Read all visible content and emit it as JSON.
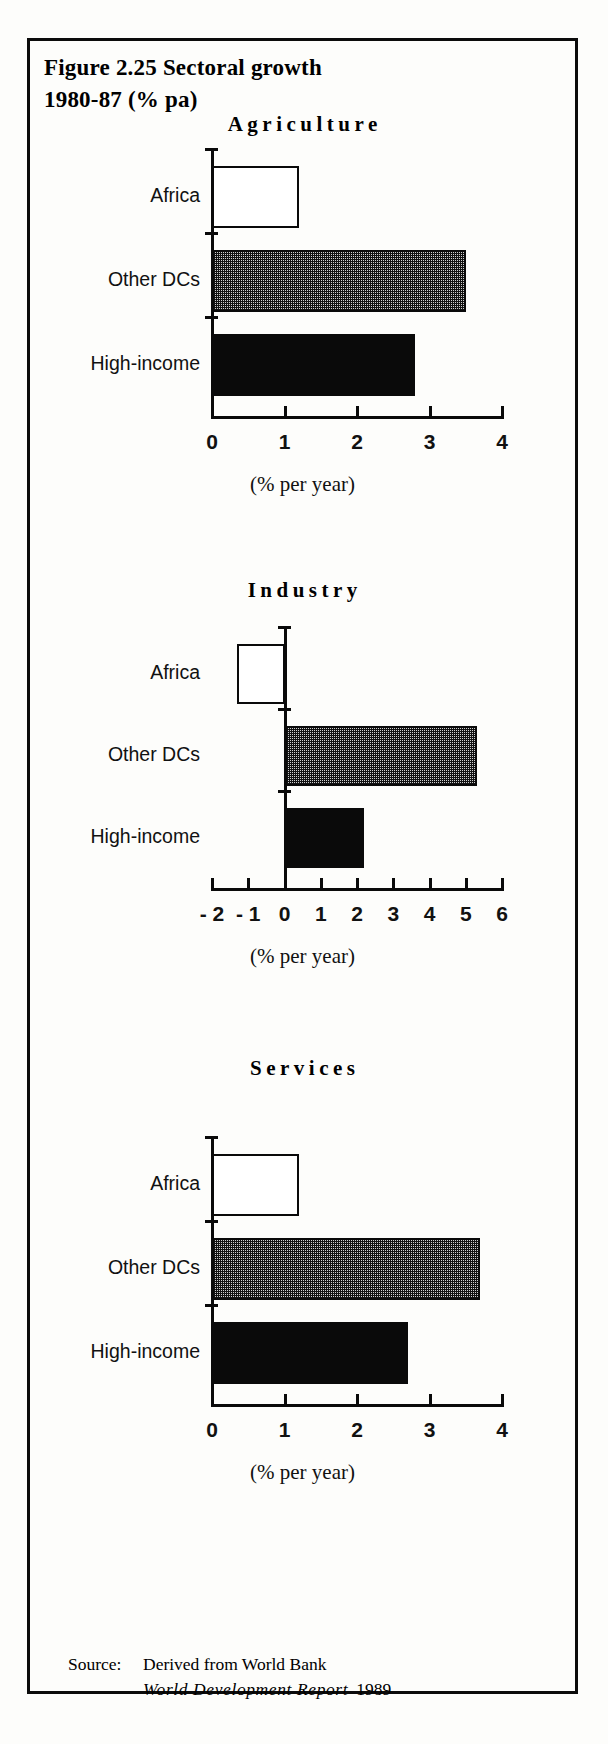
{
  "figure": {
    "title": "Figure  2.25  Sectoral  growth\n1980-87  (%  pa)"
  },
  "source": {
    "label": "Source:",
    "line1": "Derived from World Bank",
    "publication": "World  Development  Report",
    "year": "1989"
  },
  "axis_caption": "(% per year)",
  "categories": [
    "Africa",
    "Other DCs",
    "High-income"
  ],
  "chart_data": [
    {
      "type": "bar",
      "title": "Agriculture",
      "orientation": "horizontal",
      "categories": [
        "Africa",
        "Other DCs",
        "High-income"
      ],
      "values": [
        1.2,
        3.5,
        2.8
      ],
      "bar_styles": [
        "open",
        "dotted",
        "solid"
      ],
      "xlabel": "(% per year)",
      "ylabel": "",
      "xlim": [
        0,
        4
      ],
      "xticks": [
        0,
        1,
        2,
        3,
        4
      ],
      "xticklabels": [
        "0",
        "1",
        "2",
        "3",
        "4"
      ],
      "grid": false,
      "legend": "none"
    },
    {
      "type": "bar",
      "title": "Industry",
      "orientation": "horizontal",
      "categories": [
        "Africa",
        "Other DCs",
        "High-income"
      ],
      "values": [
        -1.3,
        5.3,
        2.2
      ],
      "bar_styles": [
        "open",
        "dotted",
        "solid"
      ],
      "xlabel": "(% per year)",
      "ylabel": "",
      "xlim": [
        -2,
        6
      ],
      "xticks": [
        -2,
        -1,
        0,
        1,
        2,
        3,
        4,
        5,
        6
      ],
      "xticklabels": [
        "- 2",
        "- 1",
        "0",
        "1",
        "2",
        "3",
        "4",
        "5",
        "6"
      ],
      "grid": false,
      "legend": "none"
    },
    {
      "type": "bar",
      "title": "Services",
      "orientation": "horizontal",
      "categories": [
        "Africa",
        "Other DCs",
        "High-income"
      ],
      "values": [
        1.2,
        3.7,
        2.7
      ],
      "bar_styles": [
        "open",
        "dotted",
        "solid"
      ],
      "xlabel": "(% per year)",
      "ylabel": "",
      "xlim": [
        0,
        4
      ],
      "xticks": [
        0,
        1,
        2,
        3,
        4
      ],
      "xticklabels": [
        "0",
        "1",
        "2",
        "3",
        "4"
      ],
      "grid": false,
      "legend": "none"
    }
  ],
  "colors": {
    "ink": "#0a0a0a",
    "paper": "#fdfdfb",
    "bar_open": "#ffffff",
    "bar_dotted": "#cfcfcf",
    "bar_solid": "#0a0a0a"
  }
}
